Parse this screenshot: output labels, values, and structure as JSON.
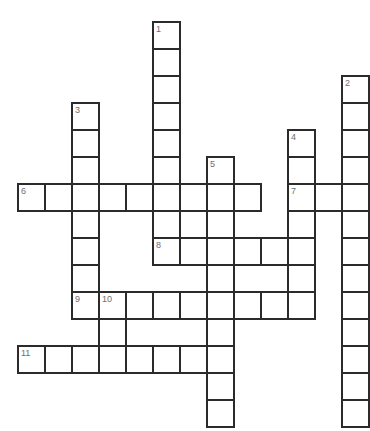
{
  "puzzle": {
    "type": "crossword-grid",
    "title": "Crossword puzzle grid",
    "geometry": {
      "cell_size": 27,
      "origin_x": 18,
      "origin_y": 22,
      "image_width": 368,
      "image_height": 431,
      "cols": 13,
      "rows": 15
    },
    "colors": {
      "cell_fill": "#ffffff",
      "cell_border": "#2b2b2b",
      "number_text": "#6e6e6e",
      "background": "#ffffff"
    },
    "entries": [
      {
        "number": "1",
        "direction": "down",
        "col": 5,
        "row": 0,
        "length": 7
      },
      {
        "number": "2",
        "direction": "down",
        "col": 12,
        "row": 2,
        "length": 13
      },
      {
        "number": "3",
        "direction": "down",
        "col": 2,
        "row": 3,
        "length": 8
      },
      {
        "number": "4",
        "direction": "down",
        "col": 10,
        "row": 4,
        "length": 7
      },
      {
        "number": "5",
        "direction": "down",
        "col": 7,
        "row": 5,
        "length": 10
      },
      {
        "number": "6",
        "direction": "across",
        "col": 0,
        "row": 6,
        "length": 9
      },
      {
        "number": "7",
        "direction": "across",
        "col": 10,
        "row": 6,
        "length": 3
      },
      {
        "number": "8",
        "direction": "across",
        "col": 5,
        "row": 8,
        "length": 6
      },
      {
        "number": "9",
        "direction": "across",
        "col": 2,
        "row": 10,
        "length": 9
      },
      {
        "number": "10",
        "direction": "down",
        "col": 3,
        "row": 10,
        "length": 3
      },
      {
        "number": "11",
        "direction": "across",
        "col": 0,
        "row": 12,
        "length": 8
      }
    ],
    "cells": [
      {
        "col": 5,
        "row": 0,
        "number": "1"
      },
      {
        "col": 5,
        "row": 1,
        "number": ""
      },
      {
        "col": 5,
        "row": 2,
        "number": ""
      },
      {
        "col": 12,
        "row": 2,
        "number": "2"
      },
      {
        "col": 5,
        "row": 3,
        "number": ""
      },
      {
        "col": 12,
        "row": 3,
        "number": ""
      },
      {
        "col": 2,
        "row": 3,
        "number": "3"
      },
      {
        "col": 5,
        "row": 4,
        "number": ""
      },
      {
        "col": 12,
        "row": 4,
        "number": ""
      },
      {
        "col": 2,
        "row": 4,
        "number": ""
      },
      {
        "col": 10,
        "row": 4,
        "number": "4"
      },
      {
        "col": 5,
        "row": 5,
        "number": ""
      },
      {
        "col": 12,
        "row": 5,
        "number": ""
      },
      {
        "col": 2,
        "row": 5,
        "number": ""
      },
      {
        "col": 10,
        "row": 5,
        "number": ""
      },
      {
        "col": 7,
        "row": 5,
        "number": "5"
      },
      {
        "col": 0,
        "row": 6,
        "number": "6"
      },
      {
        "col": 1,
        "row": 6,
        "number": ""
      },
      {
        "col": 2,
        "row": 6,
        "number": ""
      },
      {
        "col": 3,
        "row": 6,
        "number": ""
      },
      {
        "col": 4,
        "row": 6,
        "number": ""
      },
      {
        "col": 5,
        "row": 6,
        "number": ""
      },
      {
        "col": 6,
        "row": 6,
        "number": ""
      },
      {
        "col": 7,
        "row": 6,
        "number": ""
      },
      {
        "col": 8,
        "row": 6,
        "number": ""
      },
      {
        "col": 10,
        "row": 6,
        "number": "7"
      },
      {
        "col": 11,
        "row": 6,
        "number": ""
      },
      {
        "col": 12,
        "row": 6,
        "number": ""
      },
      {
        "col": 2,
        "row": 7,
        "number": ""
      },
      {
        "col": 5,
        "row": 7,
        "number": ""
      },
      {
        "col": 7,
        "row": 7,
        "number": ""
      },
      {
        "col": 10,
        "row": 7,
        "number": ""
      },
      {
        "col": 12,
        "row": 7,
        "number": ""
      },
      {
        "col": 5,
        "row": 8,
        "number": "8"
      },
      {
        "col": 6,
        "row": 8,
        "number": ""
      },
      {
        "col": 7,
        "row": 8,
        "number": ""
      },
      {
        "col": 8,
        "row": 8,
        "number": ""
      },
      {
        "col": 9,
        "row": 8,
        "number": ""
      },
      {
        "col": 10,
        "row": 8,
        "number": ""
      },
      {
        "col": 2,
        "row": 8,
        "number": ""
      },
      {
        "col": 12,
        "row": 8,
        "number": ""
      },
      {
        "col": 2,
        "row": 9,
        "number": ""
      },
      {
        "col": 7,
        "row": 9,
        "number": ""
      },
      {
        "col": 10,
        "row": 9,
        "number": ""
      },
      {
        "col": 12,
        "row": 9,
        "number": ""
      },
      {
        "col": 2,
        "row": 10,
        "number": "9"
      },
      {
        "col": 3,
        "row": 10,
        "number": "10"
      },
      {
        "col": 4,
        "row": 10,
        "number": ""
      },
      {
        "col": 5,
        "row": 10,
        "number": ""
      },
      {
        "col": 6,
        "row": 10,
        "number": ""
      },
      {
        "col": 7,
        "row": 10,
        "number": ""
      },
      {
        "col": 8,
        "row": 10,
        "number": ""
      },
      {
        "col": 9,
        "row": 10,
        "number": ""
      },
      {
        "col": 10,
        "row": 10,
        "number": ""
      },
      {
        "col": 12,
        "row": 10,
        "number": ""
      },
      {
        "col": 3,
        "row": 11,
        "number": ""
      },
      {
        "col": 7,
        "row": 11,
        "number": ""
      },
      {
        "col": 12,
        "row": 11,
        "number": ""
      },
      {
        "col": 0,
        "row": 12,
        "number": "11"
      },
      {
        "col": 1,
        "row": 12,
        "number": ""
      },
      {
        "col": 2,
        "row": 12,
        "number": ""
      },
      {
        "col": 3,
        "row": 12,
        "number": ""
      },
      {
        "col": 4,
        "row": 12,
        "number": ""
      },
      {
        "col": 5,
        "row": 12,
        "number": ""
      },
      {
        "col": 6,
        "row": 12,
        "number": ""
      },
      {
        "col": 7,
        "row": 12,
        "number": ""
      },
      {
        "col": 12,
        "row": 12,
        "number": ""
      },
      {
        "col": 7,
        "row": 13,
        "number": ""
      },
      {
        "col": 12,
        "row": 13,
        "number": ""
      },
      {
        "col": 7,
        "row": 14,
        "number": ""
      },
      {
        "col": 12,
        "row": 14,
        "number": ""
      }
    ]
  }
}
